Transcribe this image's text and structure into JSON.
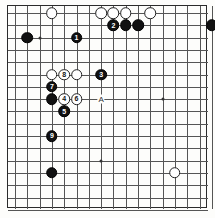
{
  "diagram": {
    "type": "go-board-diagram",
    "board": {
      "cols": 17,
      "rows": 17,
      "left": 7,
      "top": 5,
      "cell": 12.3,
      "origin_x": 14,
      "origin_y": 12,
      "line_color": "#555555",
      "border_color": "#2b2b2b",
      "background": "#fdfdfb"
    },
    "star_points": [
      {
        "col": 3,
        "row": 3
      },
      {
        "col": 8,
        "row": 8
      },
      {
        "col": 13,
        "row": 8
      },
      {
        "col": 8,
        "row": 13
      }
    ],
    "stones": [
      {
        "col": 4,
        "row": 1,
        "color": "white",
        "label": ""
      },
      {
        "col": 8,
        "row": 1,
        "color": "white",
        "label": ""
      },
      {
        "col": 9,
        "row": 1,
        "color": "white",
        "label": ""
      },
      {
        "col": 10,
        "row": 1,
        "color": "white",
        "label": ""
      },
      {
        "col": 12,
        "row": 1,
        "color": "white",
        "label": ""
      },
      {
        "col": 9,
        "row": 2,
        "color": "black",
        "label": "2"
      },
      {
        "col": 10,
        "row": 2,
        "color": "black",
        "label": ""
      },
      {
        "col": 11,
        "row": 2,
        "color": "black",
        "label": ""
      },
      {
        "col": 17,
        "row": 2,
        "color": "black",
        "label": ""
      },
      {
        "col": 2,
        "row": 3,
        "color": "black",
        "label": ""
      },
      {
        "col": 6,
        "row": 3,
        "color": "black",
        "label": "1"
      },
      {
        "col": 4,
        "row": 6,
        "color": "white",
        "label": ""
      },
      {
        "col": 5,
        "row": 6,
        "color": "white",
        "label": "8"
      },
      {
        "col": 6,
        "row": 6,
        "color": "white",
        "label": ""
      },
      {
        "col": 8,
        "row": 6,
        "color": "black",
        "label": "3"
      },
      {
        "col": 4,
        "row": 7,
        "color": "black",
        "label": "7"
      },
      {
        "col": 4,
        "row": 8,
        "color": "black",
        "label": ""
      },
      {
        "col": 5,
        "row": 8,
        "color": "white",
        "label": "4"
      },
      {
        "col": 6,
        "row": 8,
        "color": "white",
        "label": "6"
      },
      {
        "col": 5,
        "row": 9,
        "color": "black",
        "label": "5"
      },
      {
        "col": 4,
        "row": 11,
        "color": "black",
        "label": "9"
      },
      {
        "col": 4,
        "row": 14,
        "color": "black",
        "label": ""
      },
      {
        "col": 14,
        "row": 14,
        "color": "white",
        "label": ""
      }
    ],
    "markers": [
      {
        "col": 8,
        "row": 8,
        "text": "A",
        "name": "marker-a"
      }
    ]
  }
}
